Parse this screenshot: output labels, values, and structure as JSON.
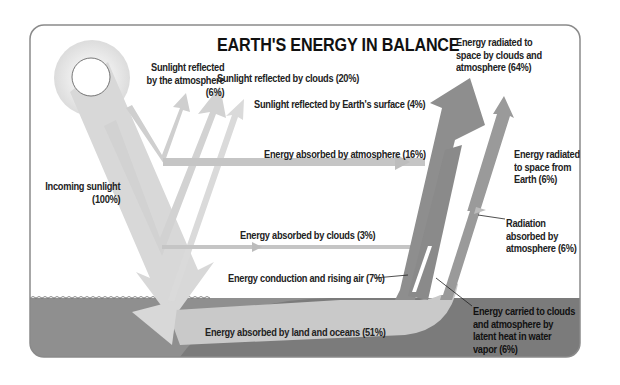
{
  "title": "EARTH'S ENERGY IN BALANCE",
  "colors": {
    "frame": "#8a8a8a",
    "incoming": "#d6d6d6",
    "sun_glow": "#e4e4e4",
    "ground": "#8c8c8c",
    "land_hill": "#7a7a7a",
    "absorbed_band": "#c4c4c4",
    "outgoing": "#8d8d8d",
    "reflected": "#d0d0d0"
  },
  "labels": {
    "reflected_atmosphere": [
      "Sunlight reflected",
      "by the atmosphere",
      "(6%)"
    ],
    "reflected_clouds": "Sunlight reflected by clouds (20%)",
    "reflected_surface": "Sunlight reflected by Earth's surface (4%)",
    "incoming": [
      "Incoming sunlight",
      "(100%)"
    ],
    "absorbed_atmosphere": "Energy absorbed by atmosphere (16%)",
    "absorbed_clouds": "Energy absorbed by clouds (3%)",
    "conduction": "Energy conduction and rising air (7%)",
    "absorbed_land": "Energy absorbed by land and oceans (51%)",
    "radiated_clouds": [
      "Energy radiated to",
      "space by clouds and",
      "atmosphere (64%)"
    ],
    "radiated_earth": [
      "Energy radiated",
      "to space from",
      "Earth (6%)"
    ],
    "radiation_absorbed": [
      "Radiation",
      "absorbed by",
      "atmosphere (6%)"
    ],
    "latent_heat": [
      "Energy carried to clouds",
      "and atmosphere by",
      "latent heat in water",
      "vapor (6%)"
    ]
  },
  "flows": [
    {
      "name": "Incoming sunlight",
      "percent": 100
    },
    {
      "name": "Sunlight reflected by the atmosphere",
      "percent": 6
    },
    {
      "name": "Sunlight reflected by clouds",
      "percent": 20
    },
    {
      "name": "Sunlight reflected by Earth's surface",
      "percent": 4
    },
    {
      "name": "Energy absorbed by atmosphere",
      "percent": 16
    },
    {
      "name": "Energy absorbed by clouds",
      "percent": 3
    },
    {
      "name": "Energy absorbed by land and oceans",
      "percent": 51
    },
    {
      "name": "Energy conduction and rising air",
      "percent": 7
    },
    {
      "name": "Energy carried to clouds and atmosphere by latent heat in water vapor",
      "percent": 6
    },
    {
      "name": "Radiation absorbed by atmosphere",
      "percent": 6
    },
    {
      "name": "Energy radiated to space from Earth",
      "percent": 6
    },
    {
      "name": "Energy radiated to space by clouds and atmosphere",
      "percent": 64
    }
  ]
}
